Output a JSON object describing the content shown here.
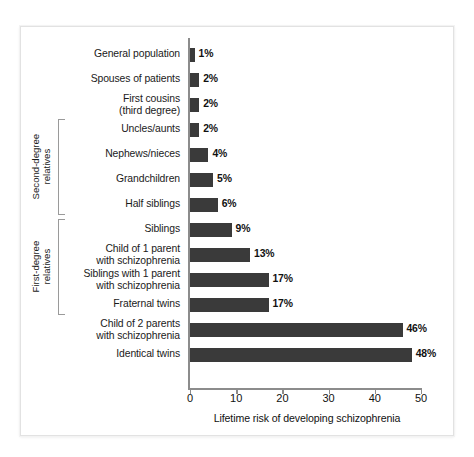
{
  "chart_data": {
    "type": "bar",
    "orientation": "horizontal",
    "title": "",
    "xlabel": "Lifetime risk of developing schizophrenia",
    "ylabel": "",
    "xlim": [
      0,
      50
    ],
    "xticks": [
      0,
      10,
      20,
      30,
      40,
      50
    ],
    "xtick_labels": [
      "0",
      "10",
      "20",
      "30",
      "40",
      "50"
    ],
    "grid": false,
    "legend": false,
    "bar_color": "#3a3a3a",
    "axis_color": "#8c8c8c",
    "background": "#ffffff",
    "value_suffix": "%",
    "categories": [
      "General population",
      "Spouses of patients",
      "First cousins\n(third degree)",
      "Uncles/aunts",
      "Nephews/nieces",
      "Grandchildren",
      "Half siblings",
      "Siblings",
      "Child of 1 parent\nwith schizophrenia",
      "Siblings with 1 parent\nwith schizophrenia",
      "Fraternal twins",
      "Child of 2 parents\nwith schizophrenia",
      "Identical twins"
    ],
    "values": [
      1,
      2,
      2,
      2,
      4,
      5,
      6,
      9,
      13,
      17,
      17,
      46,
      48
    ],
    "value_labels": [
      "1%",
      "2%",
      "2%",
      "2%",
      "4%",
      "5%",
      "6%",
      "9%",
      "13%",
      "17%",
      "17%",
      "46%",
      "48%"
    ],
    "groups": [
      {
        "label": "Second-degree\nrelatives",
        "from_index": 3,
        "to_index": 6
      },
      {
        "label": "First-degree\nrelatives",
        "from_index": 7,
        "to_index": 10
      }
    ]
  },
  "rows": [
    {
      "label_line1": "General population",
      "label_line2": "",
      "value": 1,
      "value_label": "1%"
    },
    {
      "label_line1": "Spouses of patients",
      "label_line2": "",
      "value": 2,
      "value_label": "2%"
    },
    {
      "label_line1": "First cousins",
      "label_line2": "(third degree)",
      "value": 2,
      "value_label": "2%"
    },
    {
      "label_line1": "Uncles/aunts",
      "label_line2": "",
      "value": 2,
      "value_label": "2%"
    },
    {
      "label_line1": "Nephews/nieces",
      "label_line2": "",
      "value": 4,
      "value_label": "4%"
    },
    {
      "label_line1": "Grandchildren",
      "label_line2": "",
      "value": 5,
      "value_label": "5%"
    },
    {
      "label_line1": "Half siblings",
      "label_line2": "",
      "value": 6,
      "value_label": "6%"
    },
    {
      "label_line1": "Siblings",
      "label_line2": "",
      "value": 9,
      "value_label": "9%"
    },
    {
      "label_line1": "Child of 1 parent",
      "label_line2": "with schizophrenia",
      "value": 13,
      "value_label": "13%"
    },
    {
      "label_line1": "Siblings with 1 parent",
      "label_line2": "with schizophrenia",
      "value": 17,
      "value_label": "17%"
    },
    {
      "label_line1": "Fraternal twins",
      "label_line2": "",
      "value": 17,
      "value_label": "17%"
    },
    {
      "label_line1": "Child of 2 parents",
      "label_line2": "with schizophrenia",
      "value": 46,
      "value_label": "46%"
    },
    {
      "label_line1": "Identical twins",
      "label_line2": "",
      "value": 48,
      "value_label": "48%"
    }
  ],
  "group_brackets": [
    {
      "line1": "Second-degree",
      "line2": "relatives"
    },
    {
      "line1": "First-degree",
      "line2": "relatives"
    }
  ],
  "axis": {
    "x_title": "Lifetime risk of developing schizophrenia",
    "ticks": [
      "0",
      "10",
      "20",
      "30",
      "40",
      "50"
    ]
  }
}
